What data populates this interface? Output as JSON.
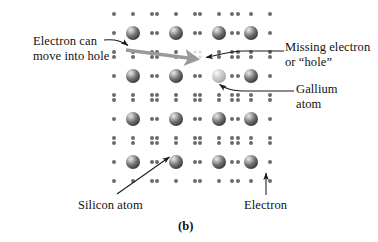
{
  "figure": {
    "panel_letter": "(b)",
    "caption_note": "Doped semiconductor lattice diagram"
  },
  "labels": {
    "electron_can_move": "Electron can\nmove into hole",
    "missing_electron": "Missing electron\nor “hole”",
    "gallium_atom": "Gallium\natom",
    "silicon_atom": "Silicon atom",
    "electron": "Electron"
  },
  "colors": {
    "background": "#ffffff",
    "text": "#111111",
    "electron_dot": "#6b6b6b",
    "silicon_sphere_dark": "#3c3c3c",
    "silicon_sphere_mid": "#7a7a7a",
    "silicon_highlight": "#e2e2e2",
    "gallium_sphere": "#b9b9b9",
    "gallium_highlight": "#f0f0f0",
    "hole_dot": "#dcdcdc",
    "thin_leader": "#1a1a1a",
    "thick_arrow": "#9a9a9a"
  },
  "lattice": {
    "description": "4 rows x 4 columns of atoms, each ringed by 8 electron dots",
    "atom_columns_x": [
      133,
      176,
      219,
      251
    ],
    "atom_rows_y": [
      33,
      76,
      119,
      162
    ],
    "dot_radius": 2.0,
    "atom_radius": 7.0,
    "electron_ring_offsets": [
      [
        -19,
        -19
      ],
      [
        0,
        -19
      ],
      [
        19,
        -19
      ],
      [
        -19,
        0
      ],
      [
        19,
        0
      ],
      [
        -19,
        19
      ],
      [
        0,
        19
      ],
      [
        19,
        19
      ]
    ],
    "atoms": [
      {
        "row": 0,
        "col": 0,
        "type": "silicon"
      },
      {
        "row": 0,
        "col": 1,
        "type": "silicon"
      },
      {
        "row": 0,
        "col": 2,
        "type": "silicon"
      },
      {
        "row": 0,
        "col": 3,
        "type": "silicon"
      },
      {
        "row": 1,
        "col": 0,
        "type": "silicon"
      },
      {
        "row": 1,
        "col": 1,
        "type": "silicon"
      },
      {
        "row": 1,
        "col": 2,
        "type": "gallium"
      },
      {
        "row": 1,
        "col": 3,
        "type": "silicon"
      },
      {
        "row": 2,
        "col": 0,
        "type": "silicon"
      },
      {
        "row": 2,
        "col": 1,
        "type": "silicon"
      },
      {
        "row": 2,
        "col": 2,
        "type": "silicon"
      },
      {
        "row": 2,
        "col": 3,
        "type": "silicon"
      },
      {
        "row": 3,
        "col": 0,
        "type": "silicon"
      },
      {
        "row": 3,
        "col": 1,
        "type": "silicon"
      },
      {
        "row": 3,
        "col": 2,
        "type": "silicon"
      },
      {
        "row": 3,
        "col": 3,
        "type": "silicon"
      }
    ],
    "hole_position": {
      "x": 200,
      "y": 57
    },
    "vacancy_note": "upper-left electron site of the gallium atom is empty (the hole)"
  },
  "annotations": {
    "thick_arrow": {
      "name": "electron-motion-arrow",
      "from": {
        "x": 126,
        "y": 50
      },
      "to": {
        "x": 196,
        "y": 59
      },
      "color": "#9a9a9a",
      "width": 3.4
    },
    "leader_electron_can": {
      "from": {
        "x": 108,
        "y": 40
      },
      "to": {
        "x": 129,
        "y": 46
      }
    },
    "leader_missing": {
      "from": {
        "x": 282,
        "y": 51
      },
      "to": {
        "x": 203,
        "y": 57
      }
    },
    "leader_gallium": {
      "from": {
        "x": 292,
        "y": 91
      },
      "to": {
        "x": 217,
        "y": 86
      }
    },
    "leader_silicon": {
      "from": {
        "x": 118,
        "y": 194
      },
      "to": {
        "x": 168,
        "y": 158
      }
    },
    "leader_electron": {
      "from": {
        "x": 266,
        "y": 194
      },
      "to": {
        "x": 266,
        "y": 172
      }
    }
  }
}
